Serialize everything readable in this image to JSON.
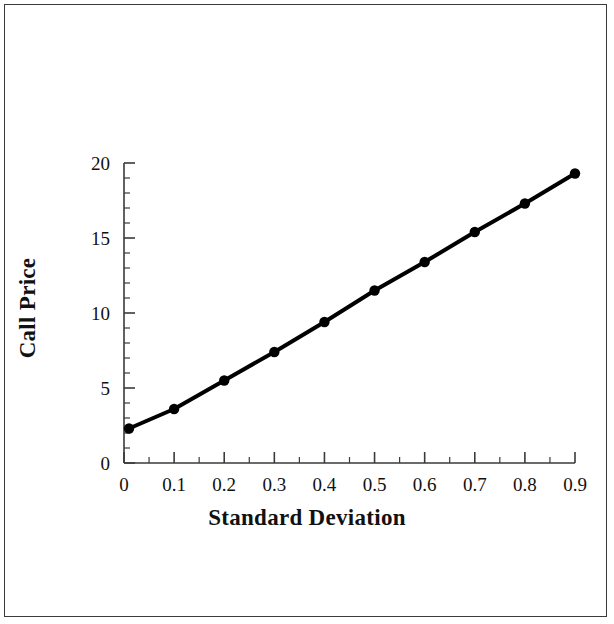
{
  "chart_data": {
    "type": "line",
    "title": "",
    "xlabel": "Standard Deviation",
    "ylabel": "Call Price",
    "xlim": [
      0,
      0.9
    ],
    "ylim": [
      0,
      20
    ],
    "grid": false,
    "legend": null,
    "x_major_ticks": [
      0,
      0.1,
      0.2,
      0.3,
      0.4,
      0.5,
      0.6,
      0.7,
      0.8,
      0.9
    ],
    "x_tick_labels": [
      "0",
      "0.1",
      "0.2",
      "0.3",
      "0.4",
      "0.5",
      "0.6",
      "0.7",
      "0.8",
      "0.9"
    ],
    "x_minor_tick_step": 0.05,
    "y_major_ticks": [
      0,
      5,
      10,
      15,
      20
    ],
    "y_tick_labels": [
      "0",
      "5",
      "10",
      "15",
      "20"
    ],
    "y_minor_tick_step": 1,
    "marker": "filled-circle",
    "line_color": "#000000",
    "marker_color": "#000000",
    "x": [
      0.01,
      0.1,
      0.2,
      0.3,
      0.4,
      0.5,
      0.6,
      0.7,
      0.8,
      0.9
    ],
    "values": [
      2.3,
      3.6,
      5.5,
      7.4,
      9.4,
      11.5,
      13.4,
      15.4,
      17.3,
      19.3
    ],
    "series": [
      {
        "name": "Call Price",
        "x": [
          0.01,
          0.1,
          0.2,
          0.3,
          0.4,
          0.5,
          0.6,
          0.7,
          0.8,
          0.9
        ],
        "values": [
          2.3,
          3.6,
          5.5,
          7.4,
          9.4,
          11.5,
          13.4,
          15.4,
          17.3,
          19.3
        ]
      }
    ]
  },
  "figure": {
    "border_color": "#3a3a3a",
    "background": "#ffffff"
  }
}
